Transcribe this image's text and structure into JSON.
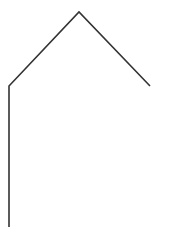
{
  "canvas": {
    "width": 175,
    "height": 239,
    "background": "#ffffff"
  },
  "drawing": {
    "type": "polyline",
    "stroke": "#333333",
    "stroke_width": 1.6,
    "points": [
      [
        9,
        227
      ],
      [
        9,
        86
      ],
      [
        79,
        12
      ],
      [
        150,
        86
      ]
    ]
  }
}
